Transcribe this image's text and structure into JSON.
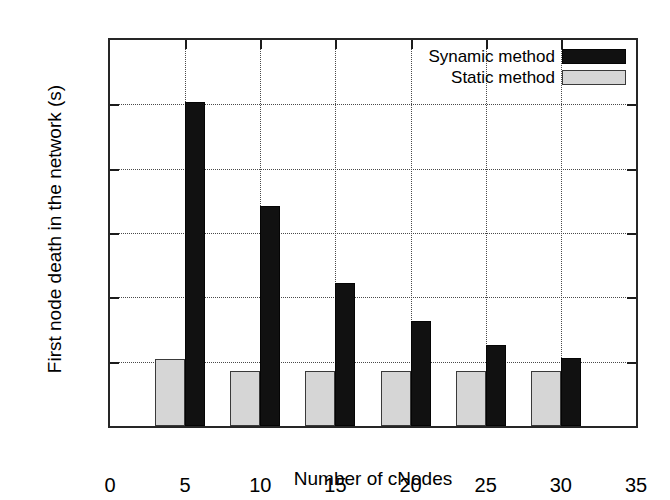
{
  "chart_data": {
    "type": "bar",
    "title": "",
    "xlabel": "Number of cNodes",
    "ylabel": "First node death in the network (s)",
    "categories": [
      "5",
      "10",
      "15",
      "20",
      "25",
      "30"
    ],
    "x": [
      5,
      10,
      15,
      20,
      25,
      30
    ],
    "series": [
      {
        "name": "Static method",
        "color": "#d6d6d6",
        "values": [
          52,
          43,
          43,
          43,
          43,
          43
        ]
      },
      {
        "name": "Synamic method",
        "color": "#111111",
        "values": [
          252,
          171,
          111,
          82,
          63,
          53
        ]
      }
    ],
    "xlim": [
      0,
      35
    ],
    "ylim": [
      0,
      300
    ],
    "xticks": [
      "0",
      "5",
      "10",
      "15",
      "20",
      "25",
      "30",
      "35"
    ],
    "xtick_values": [
      0,
      5,
      10,
      15,
      20,
      25,
      30,
      35
    ],
    "yticks": [
      "0",
      "50",
      "100",
      "150",
      "200",
      "250",
      "300"
    ],
    "ytick_values": [
      0,
      50,
      100,
      150,
      200,
      250,
      300
    ],
    "grid": true,
    "grid_style": "dotted",
    "legend_position": "top-right",
    "legend": [
      {
        "label": "Synamic method",
        "color": "#111111"
      },
      {
        "label": "Static method",
        "color": "#d6d6d6"
      }
    ]
  },
  "axes": {
    "y_title": "First node death in the network (s)",
    "x_title": "Number of cNodes"
  }
}
